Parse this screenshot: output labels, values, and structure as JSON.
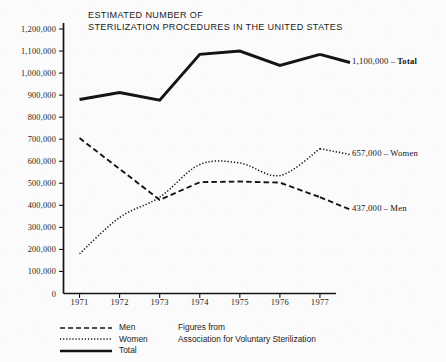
{
  "chart_data": {
    "type": "line",
    "title": "ESTIMATED NUMBER OF STERILIZATION PROCEDURES IN THE UNITED STATES",
    "title_lines": [
      "ESTIMATED NUMBER OF",
      "STERILIZATION PROCEDURES IN THE UNITED STATES"
    ],
    "xlabel": "",
    "ylabel": "",
    "categories": [
      "1971",
      "1972",
      "1973",
      "1974",
      "1975",
      "1976",
      "1977"
    ],
    "x": [
      1971,
      1972,
      1973,
      1974,
      1975,
      1976,
      1977
    ],
    "ylim": [
      0,
      1200000
    ],
    "xlim": [
      1970.6,
      1977.4
    ],
    "grid": false,
    "legend_position": "bottom-left",
    "ytick_labels": [
      "0",
      "100,000",
      "200,000",
      "300,000",
      "400,000",
      "500,000",
      "600,000",
      "700,000",
      "800,000",
      "900,000",
      "1,000,000",
      "1,100,000",
      "1,200,000"
    ],
    "ytick_values": [
      0,
      100000,
      200000,
      300000,
      400000,
      500000,
      600000,
      700000,
      800000,
      900000,
      1000000,
      1100000,
      1200000
    ],
    "series": [
      {
        "name": "Men",
        "style": "dashed",
        "values": [
          705000,
          565000,
          425000,
          505000,
          508000,
          503000,
          437000
        ]
      },
      {
        "name": "Women",
        "style": "dotted",
        "values": [
          180000,
          345000,
          437000,
          585000,
          592000,
          535000,
          657000
        ]
      },
      {
        "name": "Total",
        "style": "solid",
        "values": [
          880000,
          912000,
          877000,
          1085000,
          1100000,
          1035000,
          1085000
        ]
      }
    ],
    "annotations": [
      {
        "id": "total",
        "value_label": "1,100,000",
        "dash": "–",
        "series_name": "Total",
        "at_y": 1085000
      },
      {
        "id": "women",
        "value_label": "657,000",
        "dash": "–",
        "series_name": "Women",
        "at_y": 657000
      },
      {
        "id": "men",
        "value_label": "437,000",
        "dash": "–",
        "series_name": "Men",
        "at_y": 437000
      }
    ],
    "legend": [
      {
        "name": "Men",
        "style": "dashed"
      },
      {
        "name": "Women",
        "style": "dotted"
      },
      {
        "name": "Total",
        "style": "solid"
      }
    ],
    "source_lines": [
      "Figures from",
      "Association for Voluntary Sterilization"
    ],
    "colors": {
      "ink": "#141414",
      "background": "#fbfbfb"
    }
  }
}
